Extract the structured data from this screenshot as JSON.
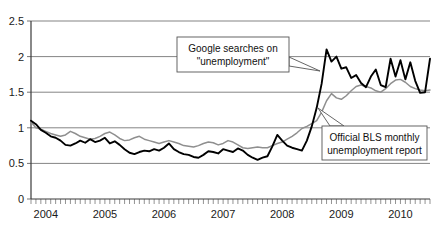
{
  "chart_data": {
    "type": "line",
    "title": "",
    "subtitle": "",
    "xlabel": "",
    "ylabel": "",
    "ylim": [
      0,
      2.5
    ],
    "xlim": [
      2004.0,
      2010.75
    ],
    "grid": true,
    "legend_position": "annotations-inline",
    "y_ticks": [
      "0",
      "0.5",
      "1",
      "1.5",
      "2",
      "2.5"
    ],
    "y_tick_values": [
      0,
      0.5,
      1,
      1.5,
      2,
      2.5
    ],
    "x_ticks": [
      "2004",
      "2005",
      "2006",
      "2007",
      "2008",
      "2009",
      "2010"
    ],
    "x_tick_values": [
      2004,
      2005,
      2006,
      2007,
      2008,
      2009,
      2010
    ],
    "x_minor_tick_interval_months": 1,
    "annotations": [
      {
        "id": "google-callout",
        "lines": [
          "Google searches on",
          "\"unemployment\""
        ],
        "points_to_series": "Google searches on \"unemployment\"",
        "points_to_x": 2009.0,
        "points_to_y": 2.05
      },
      {
        "id": "bls-callout",
        "lines": [
          "Official BLS monthly",
          "unemployment report"
        ],
        "points_to_series": "Official BLS monthly unemployment report",
        "points_to_x": 2009.1,
        "points_to_y": 1.35
      }
    ],
    "colors": {
      "google_series": "#000000",
      "bls_series": "#8f8f8f",
      "gridline": "#6e6e6e",
      "axis": "#3a3a3a",
      "background": "#ffffff",
      "callout_border": "#555555",
      "text": "#111111"
    },
    "series": [
      {
        "name": "Google searches on \"unemployment\"",
        "color": "#000000",
        "style": "solid-bold",
        "x": [
          2004.0,
          2004.083,
          2004.167,
          2004.25,
          2004.333,
          2004.417,
          2004.5,
          2004.583,
          2004.667,
          2004.75,
          2004.833,
          2004.917,
          2005.0,
          2005.083,
          2005.167,
          2005.25,
          2005.333,
          2005.417,
          2005.5,
          2005.583,
          2005.667,
          2005.75,
          2005.833,
          2005.917,
          2006.0,
          2006.083,
          2006.167,
          2006.25,
          2006.333,
          2006.417,
          2006.5,
          2006.583,
          2006.667,
          2006.75,
          2006.833,
          2006.917,
          2007.0,
          2007.083,
          2007.167,
          2007.25,
          2007.333,
          2007.417,
          2007.5,
          2007.583,
          2007.667,
          2007.75,
          2007.833,
          2007.917,
          2008.0,
          2008.083,
          2008.167,
          2008.25,
          2008.333,
          2008.417,
          2008.5,
          2008.583,
          2008.667,
          2008.75,
          2008.833,
          2008.917,
          2009.0,
          2009.083,
          2009.167,
          2009.25,
          2009.333,
          2009.417,
          2009.5,
          2009.583,
          2009.667,
          2009.75,
          2009.833,
          2009.917,
          2010.0,
          2010.083,
          2010.167,
          2010.25,
          2010.333,
          2010.417,
          2010.5,
          2010.583,
          2010.667,
          2010.75
        ],
        "values": [
          1.1,
          1.05,
          0.97,
          0.93,
          0.88,
          0.86,
          0.82,
          0.76,
          0.75,
          0.78,
          0.82,
          0.79,
          0.84,
          0.8,
          0.82,
          0.86,
          0.78,
          0.81,
          0.76,
          0.7,
          0.65,
          0.63,
          0.66,
          0.68,
          0.67,
          0.7,
          0.68,
          0.72,
          0.78,
          0.7,
          0.66,
          0.63,
          0.62,
          0.59,
          0.58,
          0.62,
          0.67,
          0.66,
          0.64,
          0.7,
          0.68,
          0.66,
          0.71,
          0.68,
          0.62,
          0.58,
          0.55,
          0.58,
          0.6,
          0.74,
          0.9,
          0.82,
          0.75,
          0.72,
          0.7,
          0.68,
          0.82,
          1.02,
          1.28,
          1.62,
          2.1,
          1.93,
          2.0,
          1.83,
          1.85,
          1.7,
          1.74,
          1.63,
          1.57,
          1.72,
          1.82,
          1.6,
          1.57,
          1.97,
          1.72,
          1.95,
          1.68,
          1.92,
          1.66,
          1.49,
          1.5,
          1.97
        ]
      },
      {
        "name": "Official BLS monthly unemployment report",
        "color": "#8f8f8f",
        "style": "solid",
        "x": [
          2004.0,
          2004.083,
          2004.167,
          2004.25,
          2004.333,
          2004.417,
          2004.5,
          2004.583,
          2004.667,
          2004.75,
          2004.833,
          2004.917,
          2005.0,
          2005.083,
          2005.167,
          2005.25,
          2005.333,
          2005.417,
          2005.5,
          2005.583,
          2005.667,
          2005.75,
          2005.833,
          2005.917,
          2006.0,
          2006.083,
          2006.167,
          2006.25,
          2006.333,
          2006.417,
          2006.5,
          2006.583,
          2006.667,
          2006.75,
          2006.833,
          2006.917,
          2007.0,
          2007.083,
          2007.167,
          2007.25,
          2007.333,
          2007.417,
          2007.5,
          2007.583,
          2007.667,
          2007.75,
          2007.833,
          2007.917,
          2008.0,
          2008.083,
          2008.167,
          2008.25,
          2008.333,
          2008.417,
          2008.5,
          2008.583,
          2008.667,
          2008.75,
          2008.833,
          2008.917,
          2009.0,
          2009.083,
          2009.167,
          2009.25,
          2009.333,
          2009.417,
          2009.5,
          2009.583,
          2009.667,
          2009.75,
          2009.833,
          2009.917,
          2010.0,
          2010.083,
          2010.167,
          2010.25,
          2010.333,
          2010.417,
          2010.5,
          2010.583,
          2010.667,
          2010.75
        ],
        "values": [
          1.08,
          1.0,
          0.98,
          0.95,
          0.92,
          0.9,
          0.88,
          0.9,
          0.95,
          0.92,
          0.88,
          0.86,
          0.84,
          0.85,
          0.88,
          0.92,
          0.94,
          0.9,
          0.85,
          0.82,
          0.83,
          0.86,
          0.88,
          0.84,
          0.82,
          0.8,
          0.78,
          0.8,
          0.82,
          0.8,
          0.78,
          0.75,
          0.74,
          0.73,
          0.75,
          0.78,
          0.8,
          0.79,
          0.76,
          0.78,
          0.82,
          0.8,
          0.76,
          0.72,
          0.71,
          0.72,
          0.73,
          0.72,
          0.72,
          0.75,
          0.78,
          0.8,
          0.84,
          0.88,
          0.93,
          0.99,
          1.02,
          1.06,
          1.1,
          1.22,
          1.38,
          1.48,
          1.42,
          1.4,
          1.45,
          1.52,
          1.58,
          1.6,
          1.58,
          1.56,
          1.52,
          1.5,
          1.55,
          1.62,
          1.67,
          1.68,
          1.64,
          1.58,
          1.55,
          1.53,
          1.52,
          1.53
        ]
      }
    ]
  }
}
